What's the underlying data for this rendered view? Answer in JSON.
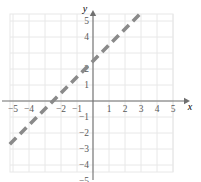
{
  "figure": {
    "kind": "coordinate-plane",
    "axis_labels": {
      "x": "x",
      "y": "y"
    }
  },
  "colors": {
    "background": "#ffffff",
    "grid": "#e8e8e8",
    "axis": "#6f6f6f",
    "tick_text": "#595959",
    "line": "#8a8a8a"
  },
  "chart_data": {
    "type": "line",
    "title": "",
    "xlabel": "x",
    "ylabel": "y",
    "xlim": [
      -5.8,
      6.8
    ],
    "ylim": [
      -5.8,
      6.2
    ],
    "grid": true,
    "legend": null,
    "x_ticks": [
      -5,
      -4,
      -3,
      -2,
      -1,
      1,
      2,
      3,
      4,
      5
    ],
    "y_ticks": [
      5,
      4,
      3,
      2,
      1,
      -1,
      -2,
      -3,
      -4,
      -5
    ],
    "x_tick_labels": [
      "-5",
      "-4",
      "-3",
      "-2",
      "-1",
      "1",
      "2",
      "3",
      "4",
      "5"
    ],
    "y_tick_labels": [
      "5",
      "4",
      "3",
      "2",
      "1",
      "-1",
      "-2",
      "-3",
      "-4",
      "-5"
    ],
    "x_tick_labels_hidden": [
      "-3"
    ],
    "y_tick_labels_hidden": [
      "3"
    ],
    "series": [
      {
        "name": "boundary-line",
        "style": "dashed",
        "slope": 1,
        "intercept": 2.5,
        "x": [
          -5.2,
          3.1
        ],
        "y": [
          -2.7,
          5.6
        ],
        "points": [
          {
            "x": -5.2,
            "y": -2.7
          },
          {
            "x": -2.5,
            "y": 0
          },
          {
            "x": 0,
            "y": 2.5
          },
          {
            "x": 3.1,
            "y": 5.6
          }
        ]
      }
    ]
  }
}
